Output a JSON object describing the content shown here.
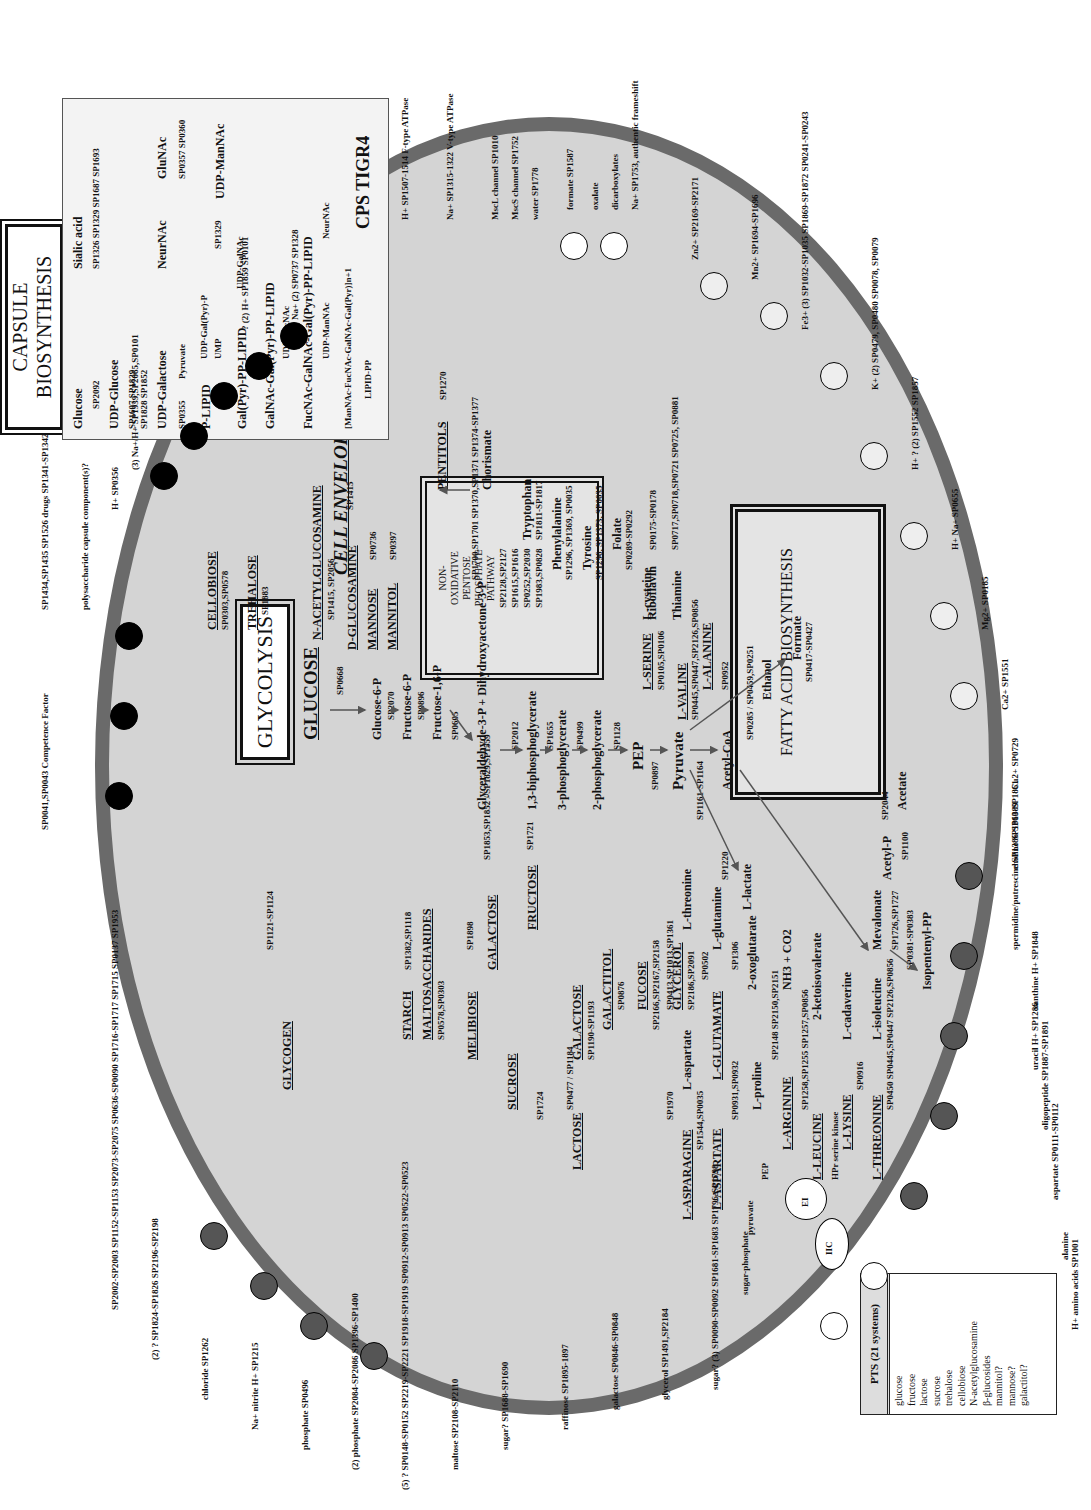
{
  "figure": {
    "orientation": "rotated-90-ccw"
  },
  "titles": {
    "capsule": "CAPSULE BIOSYNTHESIS",
    "glycolysis": "GLYCOLYSIS",
    "fatty_acid": "FATTY ACID BIOSYNTHESIS",
    "fatty_acid_genes": "SP0417-SP0427",
    "cell_envelope": "CELL ENVELOPE",
    "ppp": [
      "NON-",
      "OXIDATIVE",
      "PENTOSE",
      "PHOSPHATE",
      "PATHWAY"
    ],
    "ppp_genes": [
      "SP2128,SP2127",
      "SP1615,SP1616",
      "SP0252,SP2030",
      "SP1983,SP0828"
    ]
  },
  "cps_box": {
    "lines": [
      "Glucose",
      "SP2092",
      "UDP-Glucose",
      "SP1607 SP1829",
      "SP1828 SP1852",
      "UDP-Galactose",
      "SP0355",
      "Pyruvate",
      "Sialic acid",
      "SP1326 SP1329 SP1687 SP1693",
      "NeurNAc",
      "GluNAc",
      "SP0357 SP0360",
      "P-LIPID",
      "UDP-Gal(Pyr)-P",
      "Cps4E",
      "UMP",
      "SP1329",
      "SP1330",
      "UDP-ManNAc",
      "Gal(Pyr)-PP-LIPID",
      "UDP-GalNAc",
      "GalNAc-Gal(Pyr)-PP-LIPID",
      "UDP-FucNAc",
      "FucNAc-GalNAc-Gal(Pyr)-PP-LIPID",
      "UDP-ManNAc",
      "NeurNAc",
      "SP1329",
      "SP035",
      "[ManNAc-FucNAc-GalNAc-Gal(Pyr)]n+1",
      "SP0356",
      "LIPID-PP"
    ],
    "label": "CPS TIGR4"
  },
  "pts_box": {
    "title": "PTS (21 systems)",
    "items": [
      "glucose",
      "fructose",
      "lactose",
      "sucrose",
      "trehalose",
      "cellobiose",
      "N-acetylglucosamine",
      "β-glucosides",
      "mannitol?",
      "mannose?",
      "galactitol?"
    ]
  },
  "pts_components": [
    "IIC",
    "IIB",
    "IIA",
    "HPr",
    "EI",
    "PEP",
    "pyruvate",
    "sugar-phosphate",
    "HPr serine kinase"
  ],
  "sugars": [
    {
      "name": "STARCH",
      "genes": "SP1382,SP1118"
    },
    {
      "name": "MALTOSACCHARIDES",
      "genes": "SP0578,SP0303"
    },
    {
      "name": "MELIBIOSE",
      "genes": "SP1898"
    },
    {
      "name": "GALACTOSE",
      "genes": "SP1853,SP1852 / SP1829,SP1559"
    },
    {
      "name": "SUCROSE",
      "genes": "SP1724"
    },
    {
      "name": "FRUCTOSE",
      "genes": "SP1721"
    },
    {
      "name": "LACTOSE",
      "genes": "SP0477 / SP1184"
    },
    {
      "name": "GALACTOSE",
      "genes": "SP1190-SP1193"
    },
    {
      "name": "GALACTITOL",
      "genes": "SP0876"
    },
    {
      "name": "FUCOSE",
      "genes": "SP2166,SP2167,SP2158"
    },
    {
      "name": "GLYCEROL",
      "genes": "SP2186,SP2091"
    },
    {
      "name": "CELLOBIOSE",
      "genes": "SP0303,SP0578"
    },
    {
      "name": "TREHALOSE",
      "genes": "SP1883"
    },
    {
      "name": "N-ACETYLGLUCOSAMINE",
      "genes": "SP1415, SP2056"
    },
    {
      "name": "D-GLUCOSAMINE",
      "genes": "SP1415"
    },
    {
      "name": "MANNOSE",
      "genes": "SP0736"
    },
    {
      "name": "MANNITOL",
      "genes": "SP0397"
    },
    {
      "name": "PENTITOLS",
      "genes": "SP1270"
    },
    {
      "name": "GLYCOGEN",
      "genes": "SP1121-SP1124"
    }
  ],
  "glycolysis_chain": [
    {
      "metabolite": "GLUCOSE",
      "enzyme": "SP0668"
    },
    {
      "metabolite": "Glucose-6-P",
      "enzyme": "SP2070"
    },
    {
      "metabolite": "Fructose-6-P",
      "enzyme": "SP0896"
    },
    {
      "metabolite": "Fructose-1,6-P",
      "enzyme": "SP0605"
    },
    {
      "metabolite": "Glyceraldehyde-3-P + Dihydroxyacetone-3-P",
      "enzyme": "SP2012"
    },
    {
      "metabolite": "1,3-biphosphoglycerate",
      "enzyme": "SP1655"
    },
    {
      "metabolite": "3-phosphoglycerate",
      "enzyme": "SP0499"
    },
    {
      "metabolite": "2-phosphoglycerate",
      "enzyme": "SP1128"
    },
    {
      "metabolite": "PEP",
      "enzyme": "SP0897"
    },
    {
      "metabolite": "Pyruvate",
      "enzyme": "SP1161-SP1164"
    },
    {
      "metabolite": "Acetyl-CoA",
      "enzyme": ""
    }
  ],
  "pyruvate_branches": [
    {
      "product": "L-lactate",
      "enzyme": "SP1220"
    },
    {
      "product": "Formate",
      "enzyme": "SP0952"
    },
    {
      "product": "Ethanol",
      "enzyme": "SP0285 / SP0459,SP0251"
    },
    {
      "product": "Acetyl-P",
      "enzyme": "SP1100"
    },
    {
      "product": "Acetate",
      "enzyme": "SP2044"
    },
    {
      "product": "Mevalonate",
      "enzyme": "SP1726,SP1727"
    },
    {
      "product": "Isopentenyl-PP",
      "enzyme": "SP0381-SP0383"
    }
  ],
  "aromatic": [
    {
      "name": "Chorismate",
      "genes": "SP1700,SP1701 SP1370,SP1371 SP1374-SP1377"
    },
    {
      "name": "Tryptophan",
      "genes": "SP1811-SP1817"
    },
    {
      "name": "Phenylalanine",
      "genes": "SP1296, SP1369, SP0035"
    },
    {
      "name": "Tyrosine",
      "genes": "SP1296, SP1373, SP0035"
    },
    {
      "name": "Folate",
      "genes": "SP0289-SP0292"
    },
    {
      "name": "Riboflavin",
      "genes": "SP0175-SP0178"
    },
    {
      "name": "Thiamine",
      "genes": "SP0717,SP0718,SP0721 SP0725, SP0881"
    }
  ],
  "amino_acids": [
    {
      "name": "L-SERINE",
      "genes": "SP0105,SP0106"
    },
    {
      "name": "L-cysteine",
      "genes": "SP0589,SP2210"
    },
    {
      "name": "L-VALINE",
      "genes": "SP0445,SP0447,SP2126,SP0856"
    },
    {
      "name": "L-ALANINE",
      "genes": ""
    },
    {
      "name": "L-ASPARAGINE",
      "genes": "SP1970"
    },
    {
      "name": "L-aspartate",
      "genes": "SP0413,SP1013,SP1361"
    },
    {
      "name": "L-threonine",
      "genes": "SP1360,SP2066"
    },
    {
      "name": "L-ASPARTATE",
      "genes": "SP1544,SP0035"
    },
    {
      "name": "L-GLUTAMATE",
      "genes": "SP0502"
    },
    {
      "name": "L-glutamine",
      "genes": ""
    },
    {
      "name": "2-oxoglutarate",
      "genes": "SP1306"
    },
    {
      "name": "L-proline",
      "genes": "SP0931,SP0932"
    },
    {
      "name": "L-ARGININE",
      "genes": "SP2148 SP2150,SP2151"
    },
    {
      "name": "NH3 + CO2",
      "genes": ""
    },
    {
      "name": "L-LEUCINE",
      "genes": "SP1258,SP1255 SP1257,SP0856"
    },
    {
      "name": "2-ketoisovalerate",
      "genes": ""
    },
    {
      "name": "L-LYSINE",
      "genes": "SP0916"
    },
    {
      "name": "L-cadaverine",
      "genes": ""
    },
    {
      "name": "L-THREONINE",
      "genes": "SP0450 SP0445,SP0447 SP2126,SP0856"
    },
    {
      "name": "L-isoleucine",
      "genes": ""
    }
  ],
  "transporters_top": [
    "SP1434,SP1435 SP1526 drugs SP1341-SP1342",
    "polysaccharide capsule component(s)?",
    "H+ SP0356",
    "(3) Na+/H+ SP1939,SP2065,SP0101",
    "drugs SP1166",
    "Na+ drugs SP0972",
    "H+ drugs SP1116",
    "? (2) H+ SP1859 SP0101",
    "Na+ (2) SP0737 SP1328",
    "SP0041,SP0043 Competence Factor",
    "(8)",
    "H+ SP1507-1514 F-type ATPase",
    "Na+ SP1315-1322 V-type ATPase",
    "MscL channel SP1010",
    "MscS channel SP1752",
    "water SP1778",
    "formate SP1587",
    "oxalate",
    "dicarboxylates",
    "Na+ SP1753, authentic frameshift",
    "Zn2+ SP2169-SP2171",
    "Mn2+ SP1694-SP1696",
    "Fe3+ (3) SP1032-SP1035 SP1869-SP1872 SP0241-SP0243",
    "Cd2+ SP1625",
    "K+ (2) SP0479, SP0480 SP0078, SP0079",
    "H+ ? (2) SP1552 SP1857",
    "H+ Na+ SP0655",
    "? SP1751",
    "Mg2+ SP0185",
    "Ca2+ SP1623",
    "Ca2+ SP1551",
    "Cu2+ SP2101",
    "Cu2+ SP0729",
    "choline SP1860-SP1861"
  ],
  "transporters_bottom": [
    "spermidine/putrescine SP1386-SP1389",
    "xanthine H+ SP1848",
    "uracil H+ SP1286",
    "oligopeptide SP1887-SP1891",
    "SP1527",
    "(6) amino acid? SP1500-SP1502 SP0607-SP0610 SP0708-SP0711 SP0823-SP0824 SP0452-SP0454 SP1460-SP1461",
    "SP1241 SP1394",
    "aspartate SP0111-SP0112",
    "Na+ SP0626",
    "H+ branched chain amino acids SP0408",
    "alanine",
    "H+ amino acids SP1001",
    "branched chain amino acids SP0749-SP0753",
    "sugar? (3) SP0090-SP0092 SP1681-SP1683 SP1796-SP1798",
    "glycerol SP1491,SP2184",
    "galactose SP0846-SP0848",
    "raffinose SP1895-1897",
    "maltose SP2108-SP2110",
    "sugar? SP1688-SP1690",
    "(5) ? SP0148-SP0152 SP2219-SP2221 SP1918-SP1919 SP0912-SP0913 SP0522-SP0523",
    "(2) phosphate SP2084-SP2086 SP1396-SP1400",
    "phosphate SP0496",
    "Na+ nitrite H+ SP1215",
    "chloride SP1262",
    "(2) ? SP1824-SP1826 SP2196-SP2198",
    "SP2002-SP2003 SP1152-SP1153 SP2073-SP2075 SP0636-SP0090 SP1716-SP1717 SP1715 SP0137 SP1953"
  ],
  "energy_labels": {
    "atp": "ATP",
    "adp": "ADP"
  }
}
